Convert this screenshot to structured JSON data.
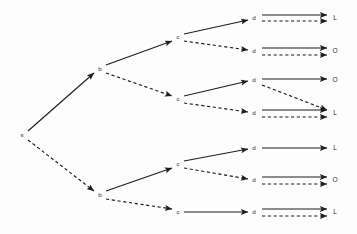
{
  "diagram": {
    "type": "directed-tree",
    "width": 357,
    "height": 234,
    "background_color": "#fdfdfd",
    "line_color": "#1d1d1d",
    "text_color": "#2b2b2b",
    "edge_styles": [
      "solid",
      "dashed"
    ],
    "columns": [
      {
        "id": "col-s",
        "label_set": "s",
        "x": 22
      },
      {
        "id": "col-b",
        "label_set": "b",
        "x": 100
      },
      {
        "id": "col-c",
        "label_set": "c",
        "x": 178
      },
      {
        "id": "col-d",
        "label_set": "d",
        "x": 254
      },
      {
        "id": "col-leaf",
        "label_set": "L/O",
        "x": 335
      }
    ],
    "nodes": [
      {
        "id": "s",
        "label": "s",
        "x": 22,
        "y": 135
      },
      {
        "id": "b1",
        "label": "b",
        "x": 100,
        "y": 69
      },
      {
        "id": "b2",
        "label": "b",
        "x": 100,
        "y": 195
      },
      {
        "id": "c1",
        "label": "c",
        "x": 178,
        "y": 37
      },
      {
        "id": "c2",
        "label": "c",
        "x": 178,
        "y": 99
      },
      {
        "id": "c3",
        "label": "c",
        "x": 178,
        "y": 164
      },
      {
        "id": "c4",
        "label": "c",
        "x": 178,
        "y": 212
      },
      {
        "id": "d1",
        "label": "d",
        "x": 254,
        "y": 18
      },
      {
        "id": "d2",
        "label": "d",
        "x": 254,
        "y": 51
      },
      {
        "id": "d3",
        "label": "d",
        "x": 254,
        "y": 80
      },
      {
        "id": "d4",
        "label": "d",
        "x": 254,
        "y": 113
      },
      {
        "id": "d5",
        "label": "d",
        "x": 254,
        "y": 148
      },
      {
        "id": "d6",
        "label": "d",
        "x": 254,
        "y": 180
      },
      {
        "id": "d7",
        "label": "d",
        "x": 254,
        "y": 212
      }
    ],
    "leaves": [
      {
        "id": "leaf1",
        "label": "L",
        "x": 335,
        "y": 18
      },
      {
        "id": "leaf2",
        "label": "O",
        "x": 335,
        "y": 51
      },
      {
        "id": "leaf3",
        "label": "O",
        "x": 335,
        "y": 80
      },
      {
        "id": "leaf4",
        "label": "L",
        "x": 335,
        "y": 113
      },
      {
        "id": "leaf5",
        "label": "L",
        "x": 335,
        "y": 148
      },
      {
        "id": "leaf6",
        "label": "O",
        "x": 335,
        "y": 180
      },
      {
        "id": "leaf7",
        "label": "L",
        "x": 335,
        "y": 212
      }
    ],
    "edges": [
      {
        "id": "e-s-b1",
        "from": "s",
        "to": "b1",
        "style": "solid",
        "x1": 28,
        "y1": 131,
        "x2": 94,
        "y2": 73
      },
      {
        "id": "e-s-b2",
        "from": "s",
        "to": "b2",
        "style": "dashed",
        "x1": 28,
        "y1": 140,
        "x2": 94,
        "y2": 191
      },
      {
        "id": "e-b1-c1",
        "from": "b1",
        "to": "c1",
        "style": "solid",
        "x1": 106,
        "y1": 65,
        "x2": 172,
        "y2": 41
      },
      {
        "id": "e-b1-c2",
        "from": "b1",
        "to": "c2",
        "style": "dashed",
        "x1": 106,
        "y1": 73,
        "x2": 172,
        "y2": 96
      },
      {
        "id": "e-b2-c3",
        "from": "b2",
        "to": "c3",
        "style": "solid",
        "x1": 106,
        "y1": 191,
        "x2": 172,
        "y2": 168
      },
      {
        "id": "e-b2-c4",
        "from": "b2",
        "to": "c4",
        "style": "dashed",
        "x1": 106,
        "y1": 199,
        "x2": 172,
        "y2": 209
      },
      {
        "id": "e-c1-d1",
        "from": "c1",
        "to": "d1",
        "style": "solid",
        "x1": 184,
        "y1": 34,
        "x2": 248,
        "y2": 20
      },
      {
        "id": "e-c1-d2",
        "from": "c1",
        "to": "d2",
        "style": "dashed",
        "x1": 184,
        "y1": 41,
        "x2": 248,
        "y2": 50
      },
      {
        "id": "e-c2-d3",
        "from": "c2",
        "to": "d3",
        "style": "solid",
        "x1": 184,
        "y1": 96,
        "x2": 248,
        "y2": 81
      },
      {
        "id": "e-c2-d4",
        "from": "c2",
        "to": "d4",
        "style": "dashed",
        "x1": 184,
        "y1": 103,
        "x2": 248,
        "y2": 112
      },
      {
        "id": "e-c3-d5",
        "from": "c3",
        "to": "d5",
        "style": "solid",
        "x1": 184,
        "y1": 161,
        "x2": 248,
        "y2": 149
      },
      {
        "id": "e-c3-d6",
        "from": "c3",
        "to": "d6",
        "style": "dashed",
        "x1": 184,
        "y1": 168,
        "x2": 248,
        "y2": 179
      },
      {
        "id": "e-c4-d7",
        "from": "c4",
        "to": "d7",
        "style": "solid",
        "x1": 184,
        "y1": 212,
        "x2": 248,
        "y2": 212
      },
      {
        "id": "e-d1-l1a",
        "from": "d1",
        "to": "leaf1",
        "style": "solid",
        "x1": 262,
        "y1": 15,
        "x2": 327,
        "y2": 15
      },
      {
        "id": "e-d1-l1b",
        "from": "d1",
        "to": "leaf1",
        "style": "dashed",
        "x1": 262,
        "y1": 21,
        "x2": 327,
        "y2": 21
      },
      {
        "id": "e-d2-l2a",
        "from": "d2",
        "to": "leaf2",
        "style": "solid",
        "x1": 262,
        "y1": 48,
        "x2": 327,
        "y2": 48
      },
      {
        "id": "e-d2-l2b",
        "from": "d2",
        "to": "leaf2",
        "style": "dashed",
        "x1": 262,
        "y1": 55,
        "x2": 327,
        "y2": 55
      },
      {
        "id": "e-d3-l3a",
        "from": "d3",
        "to": "leaf3",
        "style": "solid",
        "x1": 262,
        "y1": 79,
        "x2": 327,
        "y2": 79
      },
      {
        "id": "e-d3-l4b",
        "from": "d3",
        "to": "leaf4",
        "style": "dashed",
        "x1": 262,
        "y1": 85,
        "x2": 327,
        "y2": 110
      },
      {
        "id": "e-d4-l4a",
        "from": "d4",
        "to": "leaf4",
        "style": "solid",
        "x1": 262,
        "y1": 110,
        "x2": 327,
        "y2": 110
      },
      {
        "id": "e-d4-l4c",
        "from": "d4",
        "to": "leaf4",
        "style": "dashed",
        "x1": 262,
        "y1": 117,
        "x2": 327,
        "y2": 117
      },
      {
        "id": "e-d5-l5a",
        "from": "d5",
        "to": "leaf5",
        "style": "solid",
        "x1": 262,
        "y1": 148,
        "x2": 327,
        "y2": 148
      },
      {
        "id": "e-d6-l6a",
        "from": "d6",
        "to": "leaf6",
        "style": "solid",
        "x1": 262,
        "y1": 177,
        "x2": 327,
        "y2": 177
      },
      {
        "id": "e-d6-l6b",
        "from": "d6",
        "to": "leaf6",
        "style": "dashed",
        "x1": 262,
        "y1": 184,
        "x2": 327,
        "y2": 184
      },
      {
        "id": "e-d7-l7a",
        "from": "d7",
        "to": "leaf7",
        "style": "solid",
        "x1": 262,
        "y1": 209,
        "x2": 327,
        "y2": 209
      },
      {
        "id": "e-d7-l7b",
        "from": "d7",
        "to": "leaf7",
        "style": "dashed",
        "x1": 262,
        "y1": 216,
        "x2": 327,
        "y2": 216
      }
    ]
  }
}
